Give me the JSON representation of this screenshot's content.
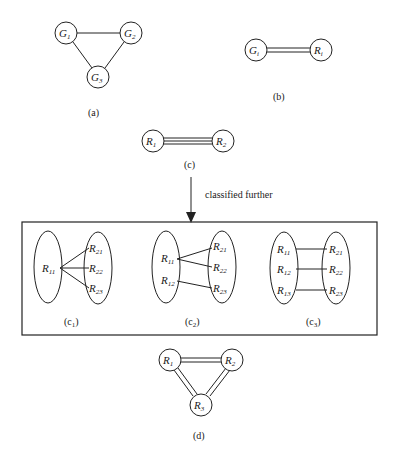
{
  "diagram": {
    "panel_a": {
      "caption": "(a)",
      "nodes": [
        {
          "base": "G",
          "sub": "1"
        },
        {
          "base": "G",
          "sub": "2"
        },
        {
          "base": "G",
          "sub": "3"
        }
      ],
      "edges": "single"
    },
    "panel_b": {
      "caption": "(b)",
      "nodes": [
        {
          "base": "G",
          "sub": "i"
        },
        {
          "base": "R",
          "sub": "i"
        }
      ],
      "edges": "double"
    },
    "panel_c": {
      "caption": "(c)",
      "nodes": [
        {
          "base": "R",
          "sub": "1"
        },
        {
          "base": "R",
          "sub": "2"
        }
      ],
      "edges": "triple"
    },
    "arrow_label": "classified further",
    "panel_c1": {
      "caption": "(c",
      "caption_sub": "1",
      "caption_end": ")",
      "left": [
        {
          "base": "R",
          "sub": "11"
        }
      ],
      "right": [
        {
          "base": "R",
          "sub": "21"
        },
        {
          "base": "R",
          "sub": "22"
        },
        {
          "base": "R",
          "sub": "23"
        }
      ]
    },
    "panel_c2": {
      "caption": "(c",
      "caption_sub": "2",
      "caption_end": ")",
      "left": [
        {
          "base": "R",
          "sub": "11"
        },
        {
          "base": "R",
          "sub": "12"
        }
      ],
      "right": [
        {
          "base": "R",
          "sub": "21"
        },
        {
          "base": "R",
          "sub": "22"
        },
        {
          "base": "R",
          "sub": "23"
        }
      ]
    },
    "panel_c3": {
      "caption": "(c",
      "caption_sub": "3",
      "caption_end": ")",
      "left": [
        {
          "base": "R",
          "sub": "11"
        },
        {
          "base": "R",
          "sub": "12"
        },
        {
          "base": "R",
          "sub": "13"
        }
      ],
      "right": [
        {
          "base": "R",
          "sub": "21"
        },
        {
          "base": "R",
          "sub": "22"
        },
        {
          "base": "R",
          "sub": "23"
        }
      ]
    },
    "panel_d": {
      "caption": "(d)",
      "nodes": [
        {
          "base": "R",
          "sub": "1"
        },
        {
          "base": "R",
          "sub": "2"
        },
        {
          "base": "R",
          "sub": "3"
        }
      ],
      "edges": "double"
    }
  }
}
